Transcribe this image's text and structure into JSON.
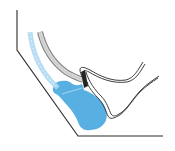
{
  "diagram": {
    "colors": {
      "background": "#ffffff",
      "outline": "#2a2a2a",
      "blob": "#4aa8e0",
      "blob_light": "#9fd0f0",
      "tube_gray": "#b8b8b8",
      "tube_gray_dark": "#7a7a7a",
      "arc_blue": "#a9d6f2",
      "connector": "#222222"
    },
    "elements": [
      {
        "name": "outer-wall",
        "type": "polyline",
        "points": [
          [
            17,
            10
          ],
          [
            17,
            50
          ],
          [
            78,
            136
          ],
          [
            163,
            136
          ]
        ]
      },
      {
        "name": "blue-arc",
        "type": "curve"
      },
      {
        "name": "gray-tube",
        "type": "curve"
      },
      {
        "name": "upper-double-line",
        "type": "curve"
      },
      {
        "name": "lower-double-line",
        "type": "curve"
      },
      {
        "name": "blue-region",
        "type": "blob"
      }
    ]
  }
}
